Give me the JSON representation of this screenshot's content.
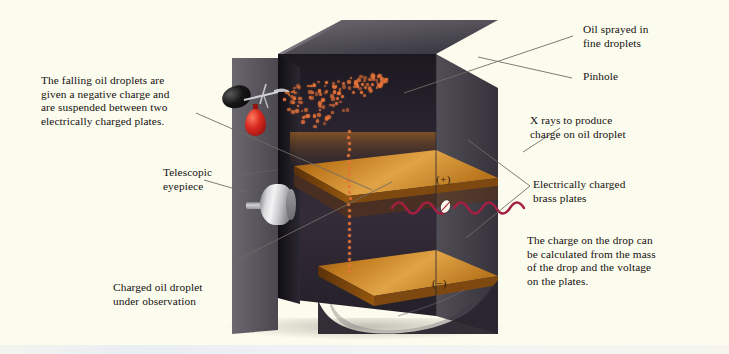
{
  "figure": {
    "background_color": "#fdfdf0"
  },
  "annotations": {
    "left_top": "The falling oil droplets are\ngiven a negative charge and\nare suspended between two\nelectrically charged plates.",
    "telescopic_eyepiece": "Telescopic\neyepiece",
    "charged_droplet": "Charged oil droplet\nunder observation",
    "oil_sprayed": "Oil sprayed in\nfine droplets",
    "pinhole": "Pinhole",
    "x_rays": "X rays to produce\ncharge on oil droplet",
    "brass_plates": "Electrically charged\nbrass plates",
    "charge_calculation": "The charge on the drop can\nbe calculated from the mass\nof the drop and the voltage\non the plates."
  },
  "apparatus": {
    "plate_positive_label": "(+)",
    "plate_negative_label": "(−)",
    "colors": {
      "chamber_dark": "#2f2b33",
      "box_gray": "#55525a",
      "plate_brass": "#c07a1e",
      "droplet_orange": "#e8743a",
      "xray_crimson": "#a61f42",
      "bulb_black": "#0b0b0b",
      "flask_red": "#c4261c",
      "eyepiece_silver": "#d4d4d8",
      "leader_line": "#6b6b63"
    },
    "parts": [
      {
        "name": "atomizer-bulb",
        "label": "rubber squeeze bulb"
      },
      {
        "name": "oil-flask",
        "label": "red oil reservoir"
      },
      {
        "name": "pinhole",
        "label": "pinhole in chamber top"
      },
      {
        "name": "oil-droplet-spray",
        "label": "fan of fine oil droplets"
      },
      {
        "name": "upper-brass-plate",
        "label": "positively charged brass plate"
      },
      {
        "name": "lower-brass-plate",
        "label": "negatively charged brass plate"
      },
      {
        "name": "x-ray-beam",
        "label": "x-ray wave entering chamber"
      },
      {
        "name": "telescopic-eyepiece",
        "label": "viewing telescope"
      },
      {
        "name": "falling-droplet-column",
        "label": "column of falling charged droplets"
      }
    ]
  }
}
